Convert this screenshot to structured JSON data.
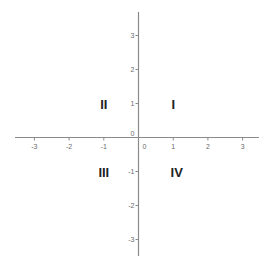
{
  "x_axis": {
    "min": -3.5,
    "max": 3.5,
    "ticks": [
      -3,
      -2,
      -1,
      0,
      1,
      2,
      3
    ],
    "tick_labels": [
      "-3",
      "-2",
      "-1",
      "0",
      "1",
      "2",
      "3"
    ]
  },
  "y_axis": {
    "min": -3.5,
    "max": 3.5,
    "ticks": [
      3,
      2,
      1,
      0,
      -1,
      -2,
      -3
    ],
    "tick_labels": [
      "3",
      "2",
      "1",
      "0",
      "-1",
      "-2",
      "-3"
    ]
  },
  "quadrants": [
    {
      "label": "I",
      "x": 1,
      "y": 1
    },
    {
      "label": "II",
      "x": -1,
      "y": 1
    },
    {
      "label": "III",
      "x": -1,
      "y": -1
    },
    {
      "label": "IV",
      "x": 1.1,
      "y": -1
    }
  ],
  "colors": {
    "axis": "#8a8a8a",
    "tick_label": "#6a6a6a",
    "quadrant_label": "#222222"
  }
}
